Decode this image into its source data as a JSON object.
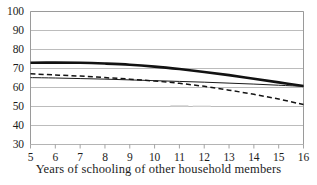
{
  "figure": {
    "cropped_header_text": "",
    "background_color": "#ffffff",
    "axis_color": "#9a9a9a",
    "grid_color": "#b4b4b4",
    "text_color": "#1c1c1c"
  },
  "chart_data": {
    "type": "line",
    "title": "",
    "subtitle": "",
    "xlabel": "Years of schooling of other household members",
    "ylabel": "",
    "xlim": [
      5,
      16
    ],
    "ylim": [
      30,
      100
    ],
    "xticks": [
      5,
      6,
      7,
      8,
      9,
      10,
      11,
      12,
      13,
      14,
      15,
      16
    ],
    "xtick_labels": [
      "5",
      "6",
      "7",
      "8",
      "9",
      "10",
      "11",
      "12",
      "13",
      "14",
      "15",
      "16"
    ],
    "yticks": [
      30,
      40,
      50,
      60,
      70,
      80,
      90,
      100
    ],
    "ytick_labels": [
      "30",
      "40",
      "50",
      "60",
      "70",
      "80",
      "90",
      "100"
    ],
    "grid": "horizontal",
    "legend": "none",
    "legend_position": "none",
    "x": [
      5,
      6,
      7,
      8,
      9,
      10,
      11,
      12,
      13,
      14,
      15,
      16
    ],
    "series": [
      {
        "name": "thick-solid",
        "style": "solid",
        "width": 2.6,
        "color": "#121212",
        "values": [
          73.0,
          73.1,
          73.0,
          72.6,
          72.0,
          71.0,
          69.7,
          68.2,
          66.5,
          64.6,
          62.7,
          60.8
        ]
      },
      {
        "name": "thin-solid",
        "style": "solid",
        "width": 1.0,
        "color": "#1a1a1a",
        "values": [
          65.2,
          65.0,
          64.7,
          64.4,
          64.0,
          63.6,
          63.2,
          62.8,
          62.3,
          61.8,
          61.2,
          60.6
        ]
      },
      {
        "name": "dashed",
        "style": "dashed",
        "width": 1.5,
        "color": "#141414",
        "values": [
          67.2,
          66.6,
          66.0,
          65.2,
          64.4,
          63.4,
          62.2,
          60.6,
          58.6,
          56.4,
          53.9,
          51.0
        ]
      }
    ],
    "artifacts": [
      {
        "name": "scan-smudge-1",
        "x": 11.0,
        "y": 50.3
      },
      {
        "name": "scan-smudge-2",
        "x": 11.9,
        "y": 50.1
      }
    ]
  }
}
